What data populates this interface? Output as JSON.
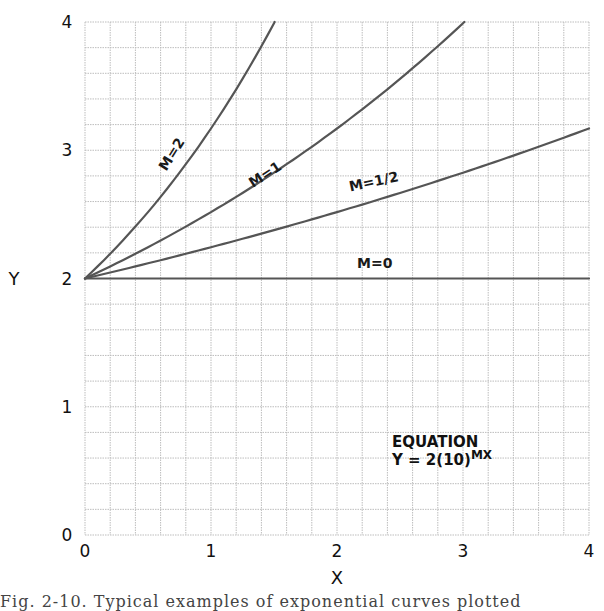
{
  "chart_data": {
    "type": "line",
    "title": "",
    "xlabel": "X",
    "ylabel": "Y",
    "xlim": [
      0,
      4
    ],
    "ylim": [
      0,
      4
    ],
    "grid": true,
    "grid_minor_per_unit": 5,
    "x_ticks": [
      "0",
      "1",
      "2",
      "3",
      "4"
    ],
    "y_ticks": [
      "0",
      "1",
      "2",
      "3",
      "4"
    ],
    "equation_label": {
      "line1": "EQUATION",
      "line2": "Y = 2(10)",
      "exponent": "MX"
    },
    "series": [
      {
        "name": "M=0",
        "m": 0,
        "x": [
          0,
          1,
          2,
          3,
          4
        ],
        "y": [
          2,
          2,
          2,
          2,
          2
        ]
      },
      {
        "name": "M=1/2",
        "m": 0.5,
        "x": [
          0,
          1,
          2,
          3,
          4
        ],
        "y": [
          2,
          2.24,
          2.52,
          2.83,
          3.17
        ]
      },
      {
        "name": "M=1",
        "m": 1,
        "x": [
          0,
          1,
          2,
          3
        ],
        "y": [
          2,
          2.52,
          3.17,
          3.99
        ]
      },
      {
        "name": "M=2",
        "m": 2,
        "x": [
          0,
          0.5,
          1,
          1.5
        ],
        "y": [
          2,
          2.52,
          3.17,
          3.99
        ]
      }
    ],
    "curve_labels": [
      {
        "text": "M=2",
        "x": 0.72,
        "y": 2.95,
        "rotate": -58
      },
      {
        "text": "M=1",
        "x": 1.45,
        "y": 2.78,
        "rotate": -33
      },
      {
        "text": "M=1/2",
        "x": 2.3,
        "y": 2.72,
        "rotate": -12
      },
      {
        "text": "M=0",
        "x": 2.3,
        "y": 2.08,
        "rotate": 0
      }
    ],
    "line_color": "#555555",
    "grid_color": "#bdbdbd"
  },
  "caption": "Fig. 2-10.  Typical examples of exponential curves plotted"
}
